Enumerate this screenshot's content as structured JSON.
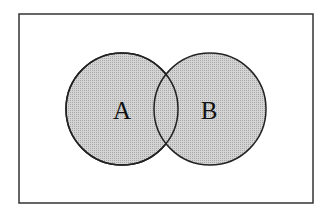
{
  "diagram": {
    "type": "venn",
    "universe": {
      "x": 19,
      "y": 14,
      "width": 294,
      "height": 189,
      "stroke": "#333333"
    },
    "sets": [
      {
        "label": "A",
        "cx": 122,
        "cy": 109,
        "r": 56,
        "fill": "#c8c8c8"
      },
      {
        "label": "B",
        "cx": 210,
        "cy": 109,
        "r": 56,
        "fill": "#c8c8c8"
      }
    ],
    "stroke_color": "#222222"
  }
}
